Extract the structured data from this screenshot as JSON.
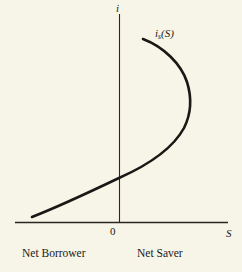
{
  "chart_data": {
    "type": "line",
    "title": "",
    "subtitle": "",
    "xlabel": "S",
    "ylabel": "i",
    "origin_label": "0",
    "grid": false,
    "legend_position": "inline-annotation",
    "xlim": [
      -100,
      110
    ],
    "ylim": [
      0,
      100
    ],
    "axes": {
      "x_axis_start_px": 15,
      "x_axis_end_px": 228,
      "x_axis_y_px": 222,
      "y_axis_x_px": 119,
      "y_axis_top_px": 14,
      "y_axis_bottom_px": 222
    },
    "annotations": [
      {
        "name": "curve-label",
        "text_i": "i",
        "text_sub": "s",
        "text_arg": "(S)",
        "full": "i_s(S)"
      },
      {
        "name": "region-left",
        "text": "Net Borrower"
      },
      {
        "name": "region-right",
        "text": "Net Saver"
      }
    ],
    "series": [
      {
        "name": "i_s(S)",
        "description": "Backward-bending savings supply curve: savings rise with the interest rate, then bend back at high interest rates.",
        "color": "#1a1714",
        "line_width_px": 2.6,
        "points_px": [
          [
            32,
            217
          ],
          [
            48,
            211
          ],
          [
            66,
            203
          ],
          [
            84,
            194
          ],
          [
            100,
            186
          ],
          [
            112,
            181
          ],
          [
            119,
            178
          ],
          [
            131,
            173
          ],
          [
            145,
            166
          ],
          [
            158,
            157
          ],
          [
            169,
            146
          ],
          [
            178,
            134
          ],
          [
            185,
            122
          ],
          [
            189,
            111
          ],
          [
            191,
            100
          ],
          [
            190,
            90
          ],
          [
            186,
            79
          ],
          [
            180,
            68
          ],
          [
            171,
            58
          ],
          [
            160,
            49
          ],
          [
            150,
            43
          ],
          [
            143,
            39
          ]
        ],
        "path_d": "M 32 217 C 60 206, 96 189, 119 178 C 146 166, 172 150, 184 128 C 191 114, 192 98, 187 82 C 181 64, 164 47, 143 39"
      }
    ],
    "curve_crosses_y_axis_at_px": [
      119,
      178
    ],
    "rightmost_point_px": [
      191,
      108
    ],
    "curve_top_endpoint_px": [
      143,
      39
    ],
    "curve_bottom_endpoint_px": [
      32,
      217
    ]
  },
  "labels": {
    "y_axis": "i",
    "x_axis": "S",
    "origin": "0",
    "curve_i": "i",
    "curve_sub": "s",
    "curve_arg": "(S)",
    "region_left": "Net Borrower",
    "region_right": "Net Saver"
  },
  "colors": {
    "background": "#f7f4e8",
    "ink": "#1a1a18",
    "curve": "#1a1714",
    "axis": "#2a2722"
  }
}
